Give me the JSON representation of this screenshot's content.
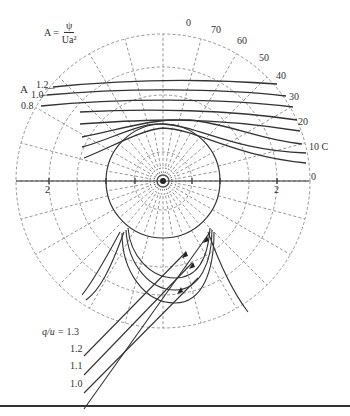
{
  "formula": {
    "lhs": "A =",
    "numerator": "ψ",
    "denominator": "Ua²"
  },
  "axis_labels": {
    "left_2": "2",
    "right_2": "2",
    "right_0": "0"
  },
  "angle_labels": [
    {
      "text": "0",
      "x": 186,
      "y": 24
    },
    {
      "text": "70",
      "x": 211,
      "y": 31
    },
    {
      "text": "60",
      "x": 237,
      "y": 42
    },
    {
      "text": "50",
      "x": 259,
      "y": 59
    },
    {
      "text": "40",
      "x": 276,
      "y": 77
    },
    {
      "text": "30",
      "x": 289,
      "y": 98
    },
    {
      "text": "20",
      "x": 298,
      "y": 123
    },
    {
      "text": "10 C",
      "x": 309,
      "y": 148
    },
    {
      "text": "0",
      "x": 311,
      "y": 178
    }
  ],
  "streamline_labels": {
    "A": "A",
    "values": [
      "1.2",
      "1.0",
      "0.8"
    ]
  },
  "q_u_labels": {
    "prefix": "q/u =",
    "values": [
      "1.3",
      "1.2",
      "1.1",
      "1.0"
    ]
  },
  "colors": {
    "line": "#333333",
    "grid": "#8a8a8a",
    "background": "#ffffff"
  }
}
